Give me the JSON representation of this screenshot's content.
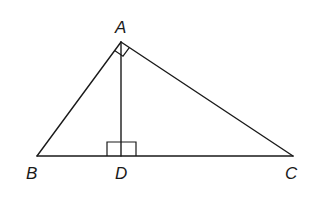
{
  "diagram": {
    "points": {
      "A": {
        "label": "A",
        "x": 121,
        "y": 42
      },
      "B": {
        "label": "B",
        "x": 37,
        "y": 156
      },
      "C": {
        "label": "C",
        "x": 293,
        "y": 156
      },
      "D": {
        "label": "D",
        "x": 121,
        "y": 156
      }
    },
    "segments": [
      "AB",
      "AC",
      "BC",
      "AD"
    ],
    "right_angles": [
      "BAC",
      "ADB",
      "ADC"
    ],
    "labels": {
      "A": "A",
      "B": "B",
      "C": "C",
      "D": "D"
    },
    "colors": {
      "stroke": "#1a1a1a",
      "background": "#ffffff"
    }
  }
}
